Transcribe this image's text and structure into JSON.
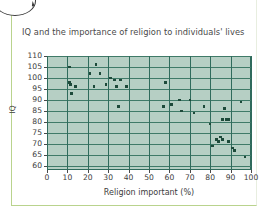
{
  "decoration": {
    "bubble_number": "6"
  },
  "chart_data": {
    "type": "scatter",
    "title": "IQ and the importance of religion to individuals' lives",
    "xlabel": "Religion important (%)",
    "ylabel": "IQ",
    "xlim": [
      0,
      100
    ],
    "ylim": [
      58,
      110
    ],
    "xticks": [
      0,
      10,
      20,
      30,
      40,
      50,
      60,
      70,
      80,
      90,
      100
    ],
    "yticks": [
      60,
      65,
      70,
      75,
      80,
      85,
      90,
      95,
      100,
      105,
      110
    ],
    "grid": true,
    "legend": null,
    "marker_color": "#1d4a3a",
    "plot_background": "#b6cfc4",
    "gridline_color": "#3f7a68",
    "points": [
      {
        "x": 11,
        "y": 105
      },
      {
        "x": 11,
        "y": 98
      },
      {
        "x": 11.5,
        "y": 97
      },
      {
        "x": 12,
        "y": 93
      },
      {
        "x": 14,
        "y": 96
      },
      {
        "x": 21,
        "y": 102
      },
      {
        "x": 23,
        "y": 96
      },
      {
        "x": 24,
        "y": 106
      },
      {
        "x": 26,
        "y": 102
      },
      {
        "x": 29,
        "y": 97
      },
      {
        "x": 31,
        "y": 100
      },
      {
        "x": 33,
        "y": 99
      },
      {
        "x": 34,
        "y": 96
      },
      {
        "x": 35,
        "y": 87
      },
      {
        "x": 36,
        "y": 99
      },
      {
        "x": 39,
        "y": 96
      },
      {
        "x": 57,
        "y": 87
      },
      {
        "x": 58,
        "y": 98
      },
      {
        "x": 61,
        "y": 88
      },
      {
        "x": 65,
        "y": 90
      },
      {
        "x": 66,
        "y": 85
      },
      {
        "x": 70,
        "y": 90
      },
      {
        "x": 72,
        "y": 84
      },
      {
        "x": 77,
        "y": 87
      },
      {
        "x": 80,
        "y": 79
      },
      {
        "x": 81,
        "y": 69
      },
      {
        "x": 83,
        "y": 72
      },
      {
        "x": 84,
        "y": 71
      },
      {
        "x": 85,
        "y": 73
      },
      {
        "x": 86,
        "y": 72
      },
      {
        "x": 86,
        "y": 81
      },
      {
        "x": 87,
        "y": 86
      },
      {
        "x": 88,
        "y": 81
      },
      {
        "x": 89,
        "y": 81
      },
      {
        "x": 89,
        "y": 71
      },
      {
        "x": 91,
        "y": 68
      },
      {
        "x": 92,
        "y": 67
      },
      {
        "x": 95,
        "y": 89
      },
      {
        "x": 97,
        "y": 64
      }
    ]
  }
}
